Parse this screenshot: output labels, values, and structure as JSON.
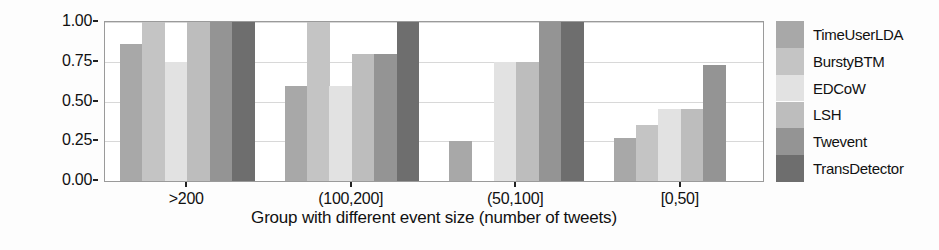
{
  "chart_data": {
    "type": "bar",
    "title": "",
    "xlabel": "Group with different event size (number of tweets)",
    "ylabel": "Recall@Benchmark1",
    "categories": [
      ">200",
      "(100,200]",
      "(50,100]",
      "[0,50]"
    ],
    "ylim": [
      0.0,
      1.0
    ],
    "yticks": [
      "0.00",
      "0.25",
      "0.50",
      "0.75",
      "1.00"
    ],
    "ytick_values": [
      0.0,
      0.25,
      0.5,
      0.75,
      1.0
    ],
    "grid": true,
    "legend_position": "right",
    "series": [
      {
        "name": "TimeUserLDA",
        "color": "#a8a8a8",
        "values": [
          0.86,
          0.6,
          0.25,
          0.27
        ]
      },
      {
        "name": "BurstyBTM",
        "color": "#c4c4c4",
        "values": [
          1.0,
          1.0,
          0.0,
          0.35
        ]
      },
      {
        "name": "EDCoW",
        "color": "#e2e2e2",
        "values": [
          0.75,
          0.6,
          0.75,
          0.45
        ]
      },
      {
        "name": "LSH",
        "color": "#bdbdbd",
        "values": [
          1.0,
          0.8,
          0.75,
          0.45
        ]
      },
      {
        "name": "Twevent",
        "color": "#949494",
        "values": [
          1.0,
          0.8,
          1.0,
          0.73
        ]
      },
      {
        "name": "TransDetector",
        "color": "#6e6e6e",
        "values": [
          1.0,
          1.0,
          1.0,
          0.0
        ]
      }
    ]
  },
  "axes": {
    "y_title": "Recall@Benchmark1",
    "x_title": "Group with different event size (number of tweets)"
  }
}
